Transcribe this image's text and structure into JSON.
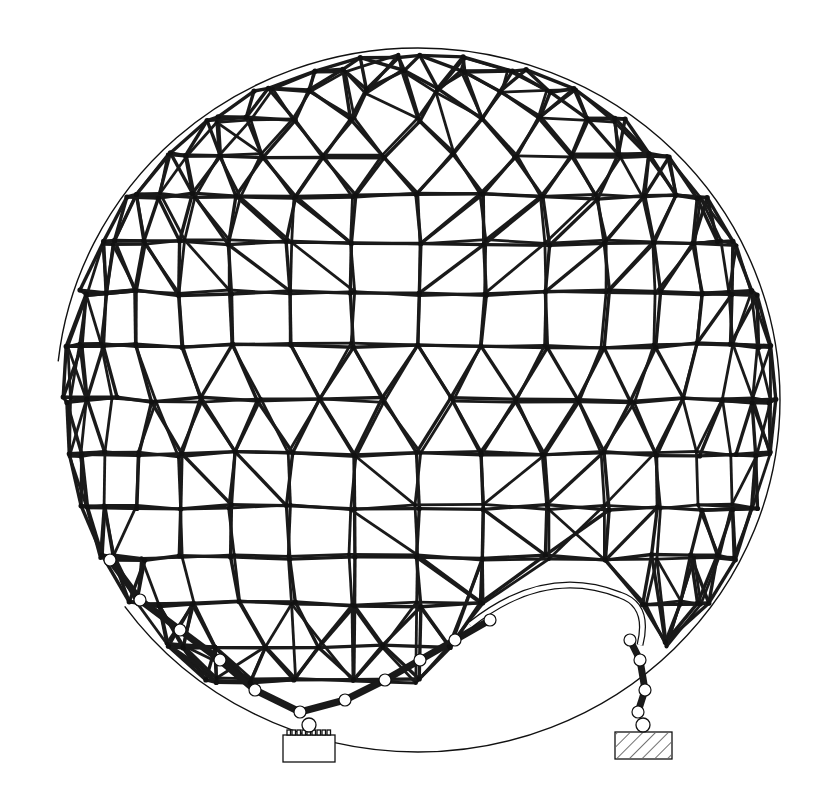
{
  "figure": {
    "title": "Geodesic space-frame dome drawing",
    "background": "#ffffff",
    "ink": "#111111"
  },
  "dome": {
    "center": [
      418,
      400
    ],
    "radius_x": 362,
    "radius_y": 352,
    "top_y": 48,
    "left_x": 56,
    "right_x": 782,
    "opening": {
      "label": "scalloped arch opening",
      "left_x": 470,
      "right_x": 620,
      "crown_y": 585
    }
  },
  "supports": [
    {
      "name": "left-pedestal",
      "style": "plain",
      "x": 283,
      "y": 735,
      "width": 52,
      "height": 27
    },
    {
      "name": "right-footing",
      "style": "hatched",
      "x": 615,
      "y": 732,
      "width": 57,
      "height": 27
    }
  ]
}
